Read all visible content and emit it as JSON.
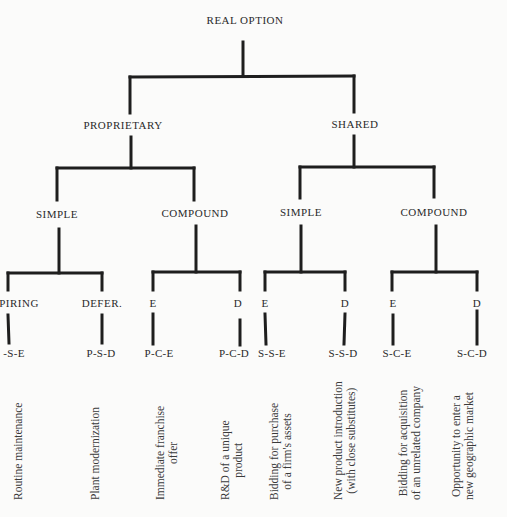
{
  "tree": {
    "root": "REAL OPTION",
    "level1": [
      {
        "label": "PROPRIETARY"
      },
      {
        "label": "SHARED"
      }
    ],
    "level2": [
      {
        "label": "SIMPLE",
        "parent": "PROPRIETARY"
      },
      {
        "label": "COMPOUND",
        "parent": "PROPRIETARY"
      },
      {
        "label": "SIMPLE",
        "parent": "SHARED"
      },
      {
        "label": "COMPOUND",
        "parent": "SHARED"
      }
    ],
    "level3": [
      {
        "label": "PIRING",
        "code": "-S-E",
        "desc1": "Routine maintenance",
        "desc2": ""
      },
      {
        "label": "DEFER.",
        "code": "P-S-D",
        "desc1": "Plant modernization",
        "desc2": ""
      },
      {
        "label": "E",
        "code": "P-C-E",
        "desc1": "Immediate franchise",
        "desc2": "offer"
      },
      {
        "label": "D",
        "code": "P-C-D",
        "desc1": "R&D of a unique",
        "desc2": "product"
      },
      {
        "label": "E",
        "code": "S-S-E",
        "desc1": "Bidding for purchase",
        "desc2": "of a firm's assets"
      },
      {
        "label": "D",
        "code": "S-S-D",
        "desc1": "New product introduction",
        "desc2": "(with close substitutes)"
      },
      {
        "label": "E",
        "code": "S-C-E",
        "desc1": "Bidding for acquisition",
        "desc2": "of an unrelated company"
      },
      {
        "label": "D",
        "code": "S-C-D",
        "desc1": "Opportunity to enter a",
        "desc2": "new geographic market"
      }
    ]
  }
}
